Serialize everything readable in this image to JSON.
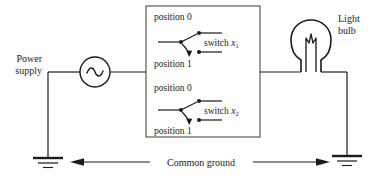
{
  "figure": {
    "type": "circuit-diagram",
    "title_text": null,
    "background_color": "#ffffff",
    "line_color": "#1a1a1a"
  },
  "labels": {
    "power_supply_line1": "Power",
    "power_supply_line2": "supply",
    "light_bulb_line1": "Light",
    "light_bulb_line2": "bulb",
    "common_ground": "Common ground"
  },
  "switch_box": {
    "switches": [
      {
        "position_top_label": "position 0",
        "position_bottom_label": "position 1",
        "name_prefix": "switch ",
        "name_var": "x",
        "name_sub": "1"
      },
      {
        "position_top_label": "position 0",
        "position_bottom_label": "position 1",
        "name_prefix": "switch ",
        "name_var": "x",
        "name_sub": "2"
      }
    ]
  },
  "components": {
    "power_supply_symbol": "ac-source-sine",
    "lamp_symbol": "incandescent-bulb",
    "ground_symbol": "earth-ground",
    "arrow_left_direction": "left",
    "arrow_right_direction": "right"
  }
}
